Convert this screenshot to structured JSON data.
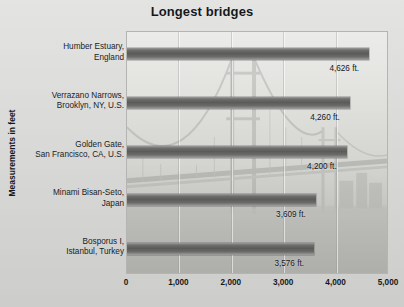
{
  "chart_data": {
    "type": "bar",
    "orientation": "horizontal",
    "title": "Longest bridges",
    "xlabel": "",
    "ylabel": "Measurements in feet",
    "categories": [
      "Humber Estuary,\nEngland",
      "Verrazano Narrows,\nBrooklyn, NY, U.S.",
      "Golden Gate,\nSan Francisco, CA, U.S.",
      "Minami Bisan-Seto,\nJapan",
      "Bosporus I,\nIstanbul, Turkey"
    ],
    "values": [
      4626,
      4260,
      4200,
      3609,
      3576
    ],
    "value_labels": [
      "4,626 ft.",
      "4,260 ft.",
      "4,200 ft.",
      "3,609 ft.",
      "3,576 ft."
    ],
    "xlim": [
      0,
      5000
    ],
    "xticks": [
      0,
      1000,
      2000,
      3000,
      4000,
      5000
    ],
    "xtick_labels": [
      "0",
      "1,000",
      "2,000",
      "3,000",
      "4,000",
      "5,000"
    ],
    "grid": "vertical",
    "legend": "none",
    "bar_color": "#5b5b59",
    "plot_background": "#d8d8d5",
    "page_background": "#d5d5d3",
    "text_color": "#15171a"
  },
  "bars": [
    {
      "name_line1": "Humber Estuary,",
      "name_line2": "England",
      "value": 4626,
      "value_label": "4,626 ft."
    },
    {
      "name_line1": "Verrazano Narrows,",
      "name_line2": "Brooklyn, NY, U.S.",
      "value": 4260,
      "value_label": "4,260 ft."
    },
    {
      "name_line1": "Golden Gate,",
      "name_line2": "San Francisco, CA, U.S.",
      "value": 4200,
      "value_label": "4,200 ft."
    },
    {
      "name_line1": "Minami Bisan-Seto,",
      "name_line2": "Japan",
      "value": 3609,
      "value_label": "3,609 ft."
    },
    {
      "name_line1": "Bosporus I,",
      "name_line2": "Istanbul, Turkey",
      "value": 3576,
      "value_label": "3,576 ft."
    }
  ],
  "axis": {
    "y_title": "Measurements in feet",
    "x_ticks": [
      "0",
      "1,000",
      "2,000",
      "3,000",
      "4,000",
      "5,000"
    ]
  },
  "watermark": {
    "name": "suspension-bridge-photo"
  }
}
